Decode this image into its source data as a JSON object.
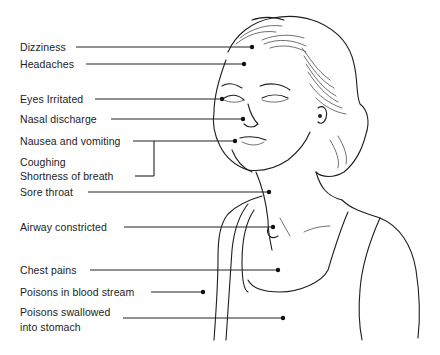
{
  "diagram": {
    "labels": [
      {
        "id": "dizziness",
        "text": "Dizziness",
        "x": 20,
        "y": 40,
        "line": {
          "x1": 76,
          "y1": 47,
          "x2": 252,
          "y2": 47
        }
      },
      {
        "id": "headaches",
        "text": "Headaches",
        "x": 20,
        "y": 57,
        "line": {
          "x1": 86,
          "y1": 64,
          "x2": 244,
          "y2": 64
        }
      },
      {
        "id": "eyes-irritated",
        "text": "Eyes Irritated",
        "x": 20,
        "y": 92,
        "line": {
          "x1": 95,
          "y1": 99,
          "x2": 222,
          "y2": 99
        }
      },
      {
        "id": "nasal-discharge",
        "text": "Nasal discharge",
        "x": 20,
        "y": 112,
        "line": {
          "x1": 111,
          "y1": 119,
          "x2": 243,
          "y2": 119
        }
      },
      {
        "id": "nausea-vomiting",
        "text": "Nausea and vomiting",
        "x": 20,
        "y": 134,
        "line": {
          "x1": 133,
          "y1": 141,
          "x2": 235,
          "y2": 141
        }
      },
      {
        "id": "coughing",
        "text": "Coughing",
        "x": 20,
        "y": 155
      },
      {
        "id": "shortness-of-breath",
        "text": "Shortness of breath",
        "x": 20,
        "y": 169
      },
      {
        "id": "sore-throat",
        "text": "Sore throat",
        "x": 20,
        "y": 185,
        "line": {
          "x1": 88,
          "y1": 192,
          "x2": 269,
          "y2": 192
        }
      },
      {
        "id": "airway-constricted",
        "text": "Airway constricted",
        "x": 20,
        "y": 220,
        "line": {
          "x1": 124,
          "y1": 227,
          "x2": 273,
          "y2": 227
        }
      },
      {
        "id": "chest-pains",
        "text": "Chest pains",
        "x": 20,
        "y": 263,
        "line": {
          "x1": 90,
          "y1": 270,
          "x2": 278,
          "y2": 270
        }
      },
      {
        "id": "blood-stream",
        "text": "Poisons in blood stream",
        "x": 20,
        "y": 285,
        "line": {
          "x1": 151,
          "y1": 292,
          "x2": 203,
          "y2": 292
        }
      },
      {
        "id": "swallowed-1",
        "text": "Poisons swallowed",
        "x": 20,
        "y": 305
      },
      {
        "id": "swallowed-2",
        "text": "into stomach",
        "x": 20,
        "y": 320,
        "line": {
          "x1": 123,
          "y1": 318,
          "x2": 283,
          "y2": 318
        }
      }
    ],
    "bracket": {
      "from_label": "shortness-of-breath",
      "to_label": "nausea-vomiting"
    },
    "line_color": "#222222",
    "text_color": "#222222",
    "background": "#ffffff"
  }
}
